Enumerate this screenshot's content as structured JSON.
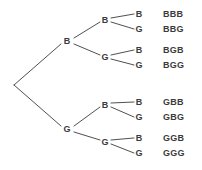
{
  "diagram": {
    "type": "probability-tree",
    "title": "",
    "stroke_color": "#3b3b3b",
    "text_color": "#3b3b3b",
    "background_color": "#ffffff",
    "root": {
      "id": "root",
      "label": "",
      "x": 14,
      "y": 85
    },
    "level1": [
      {
        "id": "n-b",
        "label": "B",
        "x": 67,
        "y": 41
      },
      {
        "id": "n-g",
        "label": "G",
        "x": 67,
        "y": 129
      }
    ],
    "level2": [
      {
        "id": "n-bb",
        "label": "B",
        "x": 105,
        "y": 20
      },
      {
        "id": "n-bg",
        "label": "G",
        "x": 105,
        "y": 57
      },
      {
        "id": "n-gb",
        "label": "B",
        "x": 105,
        "y": 105
      },
      {
        "id": "n-gg",
        "label": "G",
        "x": 105,
        "y": 142
      }
    ],
    "level3": [
      {
        "id": "n-bbb",
        "label": "B",
        "x": 139,
        "y": 14
      },
      {
        "id": "n-bbg",
        "label": "G",
        "x": 139,
        "y": 29
      },
      {
        "id": "n-bgb",
        "label": "B",
        "x": 139,
        "y": 50
      },
      {
        "id": "n-bgg",
        "label": "G",
        "x": 139,
        "y": 65
      },
      {
        "id": "n-gbb",
        "label": "B",
        "x": 139,
        "y": 102
      },
      {
        "id": "n-gbg",
        "label": "G",
        "x": 139,
        "y": 117
      },
      {
        "id": "n-ggb",
        "label": "B",
        "x": 139,
        "y": 138
      },
      {
        "id": "n-ggg",
        "label": "G",
        "x": 139,
        "y": 153
      }
    ],
    "outcomes": [
      {
        "id": "outcome-bbb",
        "text": "BBB",
        "x": 163,
        "y": 14
      },
      {
        "id": "outcome-bbg",
        "text": "BBG",
        "x": 163,
        "y": 29
      },
      {
        "id": "outcome-bgb",
        "text": "BGB",
        "x": 163,
        "y": 50
      },
      {
        "id": "outcome-bgg",
        "text": "BGG",
        "x": 163,
        "y": 65
      },
      {
        "id": "outcome-gbb",
        "text": "GBB",
        "x": 163,
        "y": 102
      },
      {
        "id": "outcome-gbg",
        "text": "GBG",
        "x": 163,
        "y": 117
      },
      {
        "id": "outcome-ggb",
        "text": "GGB",
        "x": 163,
        "y": 138
      },
      {
        "id": "outcome-ggg",
        "text": "GGG",
        "x": 163,
        "y": 153
      }
    ],
    "edges": [
      {
        "from": "root",
        "to": "n-b",
        "x1": 14,
        "y1": 85,
        "x2": 61,
        "y2": 44
      },
      {
        "from": "root",
        "to": "n-g",
        "x1": 14,
        "y1": 85,
        "x2": 61,
        "y2": 126
      },
      {
        "from": "n-b",
        "to": "n-bb",
        "x1": 74,
        "y1": 38,
        "x2": 100,
        "y2": 22
      },
      {
        "from": "n-b",
        "to": "n-bg",
        "x1": 74,
        "y1": 44,
        "x2": 100,
        "y2": 55
      },
      {
        "from": "n-g",
        "to": "n-gb",
        "x1": 74,
        "y1": 126,
        "x2": 100,
        "y2": 107
      },
      {
        "from": "n-g",
        "to": "n-gg",
        "x1": 74,
        "y1": 132,
        "x2": 100,
        "y2": 140
      },
      {
        "from": "n-bb",
        "to": "n-bbb",
        "x1": 111,
        "y1": 18,
        "x2": 134,
        "y2": 14
      },
      {
        "from": "n-bb",
        "to": "n-bbg",
        "x1": 111,
        "y1": 22,
        "x2": 134,
        "y2": 29
      },
      {
        "from": "n-bg",
        "to": "n-bgb",
        "x1": 111,
        "y1": 55,
        "x2": 134,
        "y2": 50
      },
      {
        "from": "n-bg",
        "to": "n-bgg",
        "x1": 111,
        "y1": 59,
        "x2": 134,
        "y2": 65
      },
      {
        "from": "n-gb",
        "to": "n-gbb",
        "x1": 111,
        "y1": 103,
        "x2": 134,
        "y2": 102
      },
      {
        "from": "n-gb",
        "to": "n-gbg",
        "x1": 111,
        "y1": 107,
        "x2": 134,
        "y2": 117
      },
      {
        "from": "n-gg",
        "to": "n-ggb",
        "x1": 111,
        "y1": 140,
        "x2": 134,
        "y2": 138
      },
      {
        "from": "n-gg",
        "to": "n-ggg",
        "x1": 111,
        "y1": 144,
        "x2": 134,
        "y2": 153
      }
    ]
  }
}
